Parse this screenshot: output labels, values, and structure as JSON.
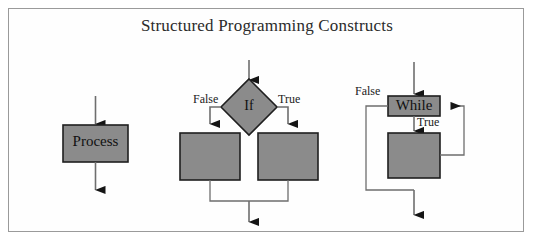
{
  "title": "Structured Programming Constructs",
  "colors": {
    "shape_fill": "#8b8b8b",
    "shape_stroke": "#1f1f1f",
    "connector": "#6e6e6e",
    "arrowhead": "#151515",
    "frame_border": "#9a9a9a",
    "background": "#ffffff",
    "text": "#1a1a1a"
  },
  "constructs": [
    {
      "id": "sequence",
      "name": "Sequence",
      "nodes": [
        {
          "id": "process-box",
          "shape": "rectangle",
          "label": "Process",
          "x": 63,
          "y": 125,
          "width": 65,
          "height": 37
        }
      ],
      "labels": []
    },
    {
      "id": "selection",
      "name": "Selection",
      "nodes": [
        {
          "id": "if-diamond",
          "shape": "diamond",
          "label": "If",
          "cx": 249,
          "cy": 107,
          "half_width": 28,
          "half_height": 28
        },
        {
          "id": "if-false-branch-box",
          "shape": "rectangle",
          "label": "",
          "x": 180,
          "y": 133,
          "width": 60,
          "height": 47
        },
        {
          "id": "if-true-branch-box",
          "shape": "rectangle",
          "label": "",
          "x": 258,
          "y": 133,
          "width": 60,
          "height": 47
        }
      ],
      "labels": [
        {
          "id": "if-false-label",
          "text": "False",
          "x": 193,
          "y": 92
        },
        {
          "id": "if-true-label",
          "text": "True",
          "x": 278,
          "y": 92
        }
      ]
    },
    {
      "id": "iteration",
      "name": "Iteration",
      "nodes": [
        {
          "id": "while-box",
          "shape": "rectangle",
          "label": "While",
          "x": 388,
          "y": 96,
          "width": 52,
          "height": 20
        },
        {
          "id": "while-body-box",
          "shape": "rectangle",
          "label": "",
          "x": 388,
          "y": 133,
          "width": 52,
          "height": 45
        }
      ],
      "labels": [
        {
          "id": "while-false-label",
          "text": "False",
          "x": 355,
          "y": 84
        },
        {
          "id": "while-true-label",
          "text": "True",
          "x": 417,
          "y": 115
        }
      ]
    }
  ]
}
